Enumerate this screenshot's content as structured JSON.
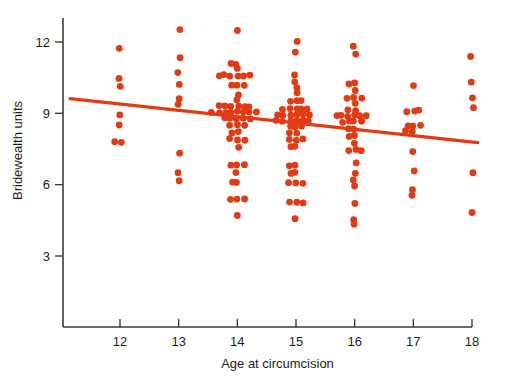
{
  "figure": {
    "background_color": "#ffffff",
    "point_color": "#e23a13",
    "line_color": "#e23a13",
    "axis_color": "#3b3b3b"
  },
  "chart_data": {
    "type": "scatter",
    "title": "",
    "subtitle": "",
    "xlabel": "Age at circumcision",
    "ylabel": "Bridewealth units",
    "xlim": [
      11.1,
      18.4
    ],
    "ylim": [
      1.2,
      13.4
    ],
    "xticks": [
      12,
      13,
      14,
      15,
      16,
      17,
      18
    ],
    "xtick_labels": [
      "12",
      "13",
      "14",
      "15",
      "16",
      "17",
      "18"
    ],
    "yticks": [
      3,
      6,
      9,
      12
    ],
    "ytick_labels": [
      "3",
      "6",
      "9",
      "12"
    ],
    "grid": false,
    "legend": null,
    "annotations": [],
    "jitter": true,
    "point_radius": 3.4,
    "series": [
      {
        "name": "observations",
        "marker": "circle",
        "color": "#e23a13",
        "points": [
          {
            "x": 12,
            "y": 11.7
          },
          {
            "x": 12,
            "y": 10.45
          },
          {
            "x": 12,
            "y": 10.1
          },
          {
            "x": 12,
            "y": 8.95
          },
          {
            "x": 12,
            "y": 8.5
          },
          {
            "x": 12,
            "y": 7.8
          },
          {
            "x": 12,
            "y": 7.8
          },
          {
            "x": 13,
            "y": 12.55
          },
          {
            "x": 13,
            "y": 11.35
          },
          {
            "x": 13,
            "y": 10.75
          },
          {
            "x": 13,
            "y": 10.2
          },
          {
            "x": 13,
            "y": 9.65
          },
          {
            "x": 13,
            "y": 9.4
          },
          {
            "x": 13,
            "y": 7.35
          },
          {
            "x": 13,
            "y": 6.5
          },
          {
            "x": 13,
            "y": 6.2
          },
          {
            "x": 14,
            "y": 12.5
          },
          {
            "x": 14,
            "y": 11.1
          },
          {
            "x": 14,
            "y": 11.1
          },
          {
            "x": 14,
            "y": 10.85
          },
          {
            "x": 14,
            "y": 10.6
          },
          {
            "x": 14,
            "y": 10.6
          },
          {
            "x": 14,
            "y": 10.6
          },
          {
            "x": 14,
            "y": 10.6
          },
          {
            "x": 14,
            "y": 10.6
          },
          {
            "x": 14,
            "y": 10.6
          },
          {
            "x": 14,
            "y": 10.15
          },
          {
            "x": 14,
            "y": 10.15
          },
          {
            "x": 14,
            "y": 10.15
          },
          {
            "x": 14,
            "y": 9.8
          },
          {
            "x": 14,
            "y": 9.55
          },
          {
            "x": 14,
            "y": 9.3
          },
          {
            "x": 14,
            "y": 9.3
          },
          {
            "x": 14,
            "y": 9.3
          },
          {
            "x": 14,
            "y": 9.3
          },
          {
            "x": 14,
            "y": 9.3
          },
          {
            "x": 14,
            "y": 9.3
          },
          {
            "x": 14,
            "y": 9.05
          },
          {
            "x": 14,
            "y": 9.05
          },
          {
            "x": 14,
            "y": 9.05
          },
          {
            "x": 14,
            "y": 9.05
          },
          {
            "x": 14,
            "y": 9.05
          },
          {
            "x": 14,
            "y": 9.05
          },
          {
            "x": 14,
            "y": 9.05
          },
          {
            "x": 14,
            "y": 9.05
          },
          {
            "x": 14,
            "y": 8.8
          },
          {
            "x": 14,
            "y": 8.8
          },
          {
            "x": 14,
            "y": 8.8
          },
          {
            "x": 14,
            "y": 8.8
          },
          {
            "x": 14,
            "y": 8.8
          },
          {
            "x": 14,
            "y": 8.5
          },
          {
            "x": 14,
            "y": 8.5
          },
          {
            "x": 14,
            "y": 8.5
          },
          {
            "x": 14,
            "y": 8.2
          },
          {
            "x": 14,
            "y": 8.2
          },
          {
            "x": 14,
            "y": 7.9
          },
          {
            "x": 14,
            "y": 7.9
          },
          {
            "x": 14,
            "y": 7.9
          },
          {
            "x": 14,
            "y": 7.6
          },
          {
            "x": 14,
            "y": 6.85
          },
          {
            "x": 14,
            "y": 6.85
          },
          {
            "x": 14,
            "y": 6.85
          },
          {
            "x": 14,
            "y": 6.5
          },
          {
            "x": 14,
            "y": 6.1
          },
          {
            "x": 14,
            "y": 6.1
          },
          {
            "x": 14,
            "y": 5.4
          },
          {
            "x": 14,
            "y": 5.4
          },
          {
            "x": 14,
            "y": 5.4
          },
          {
            "x": 14,
            "y": 4.7
          },
          {
            "x": 15,
            "y": 12.0
          },
          {
            "x": 15,
            "y": 11.6
          },
          {
            "x": 15,
            "y": 10.6
          },
          {
            "x": 15,
            "y": 10.35
          },
          {
            "x": 15,
            "y": 10.1
          },
          {
            "x": 15,
            "y": 9.85
          },
          {
            "x": 15,
            "y": 9.5
          },
          {
            "x": 15,
            "y": 9.5
          },
          {
            "x": 15,
            "y": 9.5
          },
          {
            "x": 15,
            "y": 9.2
          },
          {
            "x": 15,
            "y": 9.2
          },
          {
            "x": 15,
            "y": 9.2
          },
          {
            "x": 15,
            "y": 9.2
          },
          {
            "x": 15,
            "y": 9.2
          },
          {
            "x": 15,
            "y": 8.95
          },
          {
            "x": 15,
            "y": 8.95
          },
          {
            "x": 15,
            "y": 8.95
          },
          {
            "x": 15,
            "y": 8.95
          },
          {
            "x": 15,
            "y": 8.95
          },
          {
            "x": 15,
            "y": 8.95
          },
          {
            "x": 15,
            "y": 8.7
          },
          {
            "x": 15,
            "y": 8.7
          },
          {
            "x": 15,
            "y": 8.7
          },
          {
            "x": 15,
            "y": 8.7
          },
          {
            "x": 15,
            "y": 8.7
          },
          {
            "x": 15,
            "y": 8.7
          },
          {
            "x": 15,
            "y": 8.45
          },
          {
            "x": 15,
            "y": 8.45
          },
          {
            "x": 15,
            "y": 8.45
          },
          {
            "x": 15,
            "y": 8.2
          },
          {
            "x": 15,
            "y": 8.2
          },
          {
            "x": 15,
            "y": 7.9
          },
          {
            "x": 15,
            "y": 7.9
          },
          {
            "x": 15,
            "y": 7.9
          },
          {
            "x": 15,
            "y": 7.6
          },
          {
            "x": 15,
            "y": 7.6
          },
          {
            "x": 15,
            "y": 6.8
          },
          {
            "x": 15,
            "y": 6.8
          },
          {
            "x": 15,
            "y": 6.5
          },
          {
            "x": 15,
            "y": 6.5
          },
          {
            "x": 15,
            "y": 6.05
          },
          {
            "x": 15,
            "y": 6.05
          },
          {
            "x": 15,
            "y": 6.05
          },
          {
            "x": 15,
            "y": 5.25
          },
          {
            "x": 15,
            "y": 5.25
          },
          {
            "x": 15,
            "y": 5.25
          },
          {
            "x": 15,
            "y": 4.6
          },
          {
            "x": 16,
            "y": 11.85
          },
          {
            "x": 16,
            "y": 11.5
          },
          {
            "x": 16,
            "y": 10.25
          },
          {
            "x": 16,
            "y": 10.25
          },
          {
            "x": 16,
            "y": 9.95
          },
          {
            "x": 16,
            "y": 9.65
          },
          {
            "x": 16,
            "y": 9.65
          },
          {
            "x": 16,
            "y": 9.65
          },
          {
            "x": 16,
            "y": 9.4
          },
          {
            "x": 16,
            "y": 9.15
          },
          {
            "x": 16,
            "y": 9.15
          },
          {
            "x": 16,
            "y": 8.9
          },
          {
            "x": 16,
            "y": 8.9
          },
          {
            "x": 16,
            "y": 8.9
          },
          {
            "x": 16,
            "y": 8.9
          },
          {
            "x": 16,
            "y": 8.9
          },
          {
            "x": 16,
            "y": 8.9
          },
          {
            "x": 16,
            "y": 8.65
          },
          {
            "x": 16,
            "y": 8.65
          },
          {
            "x": 16,
            "y": 8.65
          },
          {
            "x": 16,
            "y": 8.65
          },
          {
            "x": 16,
            "y": 8.35
          },
          {
            "x": 16,
            "y": 8.35
          },
          {
            "x": 16,
            "y": 8.05
          },
          {
            "x": 16,
            "y": 8.05
          },
          {
            "x": 16,
            "y": 7.75
          },
          {
            "x": 16,
            "y": 7.45
          },
          {
            "x": 16,
            "y": 7.45
          },
          {
            "x": 16,
            "y": 7.45
          },
          {
            "x": 16,
            "y": 6.95
          },
          {
            "x": 16,
            "y": 6.45
          },
          {
            "x": 16,
            "y": 6.2
          },
          {
            "x": 16,
            "y": 5.95
          },
          {
            "x": 16,
            "y": 5.2
          },
          {
            "x": 16,
            "y": 4.55
          },
          {
            "x": 16,
            "y": 4.3
          },
          {
            "x": 17,
            "y": 10.2
          },
          {
            "x": 17,
            "y": 9.1
          },
          {
            "x": 17,
            "y": 9.1
          },
          {
            "x": 17,
            "y": 9.1
          },
          {
            "x": 17,
            "y": 8.5
          },
          {
            "x": 17,
            "y": 8.5
          },
          {
            "x": 17,
            "y": 8.5
          },
          {
            "x": 17,
            "y": 8.25
          },
          {
            "x": 17,
            "y": 8.25
          },
          {
            "x": 17,
            "y": 7.4
          },
          {
            "x": 17,
            "y": 6.6
          },
          {
            "x": 17,
            "y": 5.8
          },
          {
            "x": 17,
            "y": 5.55
          },
          {
            "x": 18,
            "y": 11.4
          },
          {
            "x": 18,
            "y": 10.35
          },
          {
            "x": 18,
            "y": 9.65
          },
          {
            "x": 18,
            "y": 9.2
          },
          {
            "x": 18,
            "y": 6.5
          },
          {
            "x": 18,
            "y": 4.85
          }
        ]
      }
    ],
    "fit_line": {
      "name": "regression line",
      "color": "#e23a13",
      "x_start": 11.15,
      "y_start": 9.62,
      "x_end": 18.1,
      "y_end": 7.77
    }
  }
}
